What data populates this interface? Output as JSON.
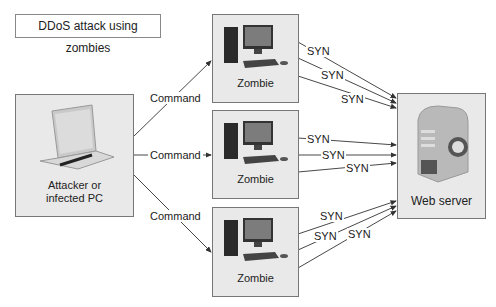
{
  "title": "DDoS attack using zombies",
  "attacker": {
    "label_line1": "Attacker or",
    "label_line2": "infected PC",
    "icon": "laptop-icon"
  },
  "zombies": [
    {
      "label": "Zombie",
      "icon": "desktop-computer-icon"
    },
    {
      "label": "Zombie",
      "icon": "desktop-computer-icon"
    },
    {
      "label": "Zombie",
      "icon": "desktop-computer-icon"
    }
  ],
  "server": {
    "label": "Web server",
    "icon": "server-globe-icon"
  },
  "commands": [
    "Command",
    "Command",
    "Command"
  ],
  "syn_labels": [
    "SYN",
    "SYN",
    "SYN",
    "SYN",
    "SYN",
    "SYN",
    "SYN",
    "SYN",
    "SYN"
  ],
  "colors": {
    "box_fill": "#e9e9e9",
    "box_border": "#777777",
    "line": "#333333"
  }
}
